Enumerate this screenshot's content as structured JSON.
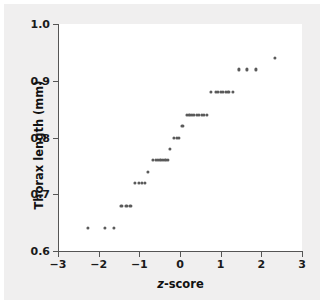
{
  "chart_data": {
    "type": "scatter",
    "title": "",
    "xlabel": "z-score",
    "xlabel_italic_part": "z",
    "xlabel_rest": "-score",
    "ylabel": "Thorax length (mm)",
    "xlim": [
      -3,
      3
    ],
    "ylim": [
      0.6,
      1.0
    ],
    "xticks": [
      -3,
      -2,
      -1,
      0,
      1,
      2,
      3
    ],
    "xticklabels": [
      "−3",
      "−2",
      "−1",
      "0",
      "1",
      "2",
      "3"
    ],
    "yticks": [
      0.6,
      0.7,
      0.8,
      0.9,
      1.0
    ],
    "yticklabels": [
      "0.6",
      "0.7",
      "0.8",
      "0.9",
      "1.0"
    ],
    "grid": false,
    "legend": null,
    "marker_color": "#5a5a5a",
    "background_color": "#f0efef",
    "plot_background_color": "#ffffff",
    "axis_color": "#555555",
    "points": [
      {
        "x": -2.26,
        "y": 0.64
      },
      {
        "x": -1.85,
        "y": 0.64
      },
      {
        "x": -1.62,
        "y": 0.64
      },
      {
        "x": -1.44,
        "y": 0.68
      },
      {
        "x": -1.32,
        "y": 0.68
      },
      {
        "x": -1.22,
        "y": 0.68
      },
      {
        "x": -1.1,
        "y": 0.72
      },
      {
        "x": -1.01,
        "y": 0.72
      },
      {
        "x": -0.93,
        "y": 0.72
      },
      {
        "x": -0.86,
        "y": 0.72
      },
      {
        "x": -0.78,
        "y": 0.74
      },
      {
        "x": -0.66,
        "y": 0.76
      },
      {
        "x": -0.6,
        "y": 0.76
      },
      {
        "x": -0.54,
        "y": 0.76
      },
      {
        "x": -0.48,
        "y": 0.76
      },
      {
        "x": -0.42,
        "y": 0.76
      },
      {
        "x": -0.36,
        "y": 0.76
      },
      {
        "x": -0.3,
        "y": 0.76
      },
      {
        "x": -0.24,
        "y": 0.78
      },
      {
        "x": -0.14,
        "y": 0.8
      },
      {
        "x": -0.08,
        "y": 0.8
      },
      {
        "x": -0.02,
        "y": 0.8
      },
      {
        "x": 0.06,
        "y": 0.82
      },
      {
        "x": 0.17,
        "y": 0.84
      },
      {
        "x": 0.23,
        "y": 0.84
      },
      {
        "x": 0.29,
        "y": 0.84
      },
      {
        "x": 0.35,
        "y": 0.84
      },
      {
        "x": 0.41,
        "y": 0.84
      },
      {
        "x": 0.47,
        "y": 0.84
      },
      {
        "x": 0.53,
        "y": 0.84
      },
      {
        "x": 0.59,
        "y": 0.84
      },
      {
        "x": 0.66,
        "y": 0.84
      },
      {
        "x": 0.76,
        "y": 0.88
      },
      {
        "x": 0.88,
        "y": 0.88
      },
      {
        "x": 0.94,
        "y": 0.88
      },
      {
        "x": 1.0,
        "y": 0.88
      },
      {
        "x": 1.06,
        "y": 0.88
      },
      {
        "x": 1.12,
        "y": 0.88
      },
      {
        "x": 1.19,
        "y": 0.88
      },
      {
        "x": 1.31,
        "y": 0.88
      },
      {
        "x": 1.45,
        "y": 0.92
      },
      {
        "x": 1.64,
        "y": 0.92
      },
      {
        "x": 1.86,
        "y": 0.92
      },
      {
        "x": 2.33,
        "y": 0.94
      }
    ]
  }
}
